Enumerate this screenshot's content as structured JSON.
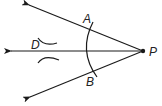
{
  "diagram": {
    "vertex": {
      "label": "P"
    },
    "arc_points": [
      {
        "label": "A"
      },
      {
        "label": "B"
      }
    ],
    "bisector_point": {
      "label": "D"
    },
    "stroke_color": "#1a1a1a"
  }
}
